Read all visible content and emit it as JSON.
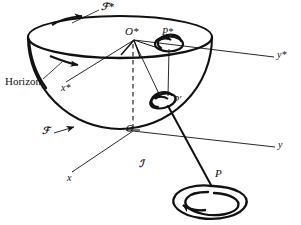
{
  "figure": {
    "type": "geometric-diagram",
    "width": 301,
    "height": 225,
    "background_color": "#ffffff",
    "ink_color": "#111111"
  },
  "labels": {
    "horizon": "Horizon",
    "surface_star": "ℱ*",
    "surface": "ℱ",
    "origin_star": "O*",
    "origin": "O",
    "point_star": "P*",
    "point_image": "P′",
    "point": "P",
    "axis_x_star": "x*",
    "axis_y_star": "y*",
    "axis_x": "x",
    "axis_y": "y",
    "region": "ℐ"
  },
  "label_positions": {
    "surface_star": {
      "x": 101,
      "y": 4
    },
    "horizon": {
      "x": 6,
      "y": 81
    },
    "axis_x_star": {
      "x": 62,
      "y": 87
    },
    "origin_star": {
      "x": 126,
      "y": 31
    },
    "point_star": {
      "x": 162,
      "y": 31
    },
    "axis_y_star": {
      "x": 278,
      "y": 55
    },
    "point_image": {
      "x": 171,
      "y": 98
    },
    "origin": {
      "x": 127,
      "y": 128
    },
    "surface": {
      "x": 44,
      "y": 130
    },
    "axis_y": {
      "x": 279,
      "y": 145
    },
    "region": {
      "x": 140,
      "y": 163
    },
    "axis_x": {
      "x": 68,
      "y": 177
    },
    "point": {
      "x": 216,
      "y": 172
    }
  },
  "geometry": {
    "rim_ellipse": {
      "cx": 120,
      "cy": 37,
      "rx": 92,
      "ry": 21
    },
    "bowl_bottom": {
      "cx": 120,
      "cy": 37,
      "r": 92
    },
    "axis_origin_star": {
      "x": 134,
      "y": 40
    },
    "axis_origin": {
      "x": 133,
      "y": 131
    },
    "loop_star": {
      "cx": 169,
      "cy": 44,
      "rx": 14,
      "ry": 8
    },
    "loop_image": {
      "cx": 163,
      "cy": 102,
      "rx": 13,
      "ry": 8
    },
    "loop_point": {
      "cx": 212,
      "cy": 198,
      "rx": 28,
      "ry": 14
    }
  },
  "elements": [
    {
      "name": "hemisphere-bowl",
      "kind": "surface"
    },
    {
      "name": "rim-ellipse",
      "kind": "horizon-circle"
    },
    {
      "name": "vertical-dashed-axis",
      "kind": "axis"
    },
    {
      "name": "projection-ray-O-star-to-P",
      "kind": "ray"
    },
    {
      "name": "vortex-loop-P-star",
      "kind": "loop"
    },
    {
      "name": "vortex-loop-P-prime",
      "kind": "loop"
    },
    {
      "name": "vortex-loop-P",
      "kind": "loop"
    }
  ]
}
